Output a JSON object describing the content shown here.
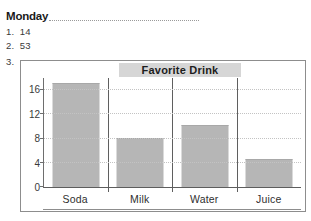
{
  "worksheet": {
    "day_label": "Monday",
    "items": [
      {
        "number": "1.",
        "value": "14"
      },
      {
        "number": "2.",
        "value": "53"
      },
      {
        "number": "3.",
        "value": ""
      }
    ]
  },
  "chart_data": {
    "type": "bar",
    "title": "Favorite Drink",
    "categories": [
      "Soda",
      "Milk",
      "Water",
      "Juice"
    ],
    "values": [
      17,
      8,
      10,
      4.5
    ],
    "xlabel": "",
    "ylabel": "",
    "ylim": [
      0,
      18
    ],
    "yticks": [
      0,
      4,
      8,
      12,
      16
    ],
    "ytick_labels": [
      "0",
      "4",
      "8",
      "12",
      "16"
    ],
    "grid": true,
    "legend": false,
    "bar_color": "#b6b6b6",
    "title_banner_color": "#d6d6d6"
  }
}
